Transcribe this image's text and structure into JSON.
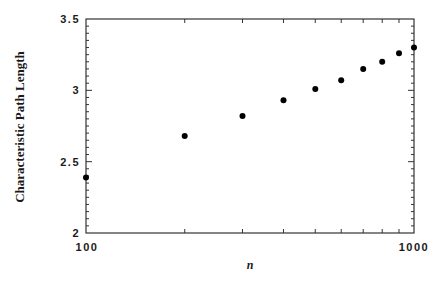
{
  "chart_data": {
    "type": "scatter",
    "title": "",
    "xlabel": "n",
    "ylabel": "Characteristic Path Length",
    "xscale": "log",
    "xlim": [
      100,
      1000
    ],
    "ylim": [
      2,
      3.5
    ],
    "x_tick_labels": [
      "100",
      "1000"
    ],
    "y_tick_labels": [
      "2",
      "2.5",
      "3",
      "3.5"
    ],
    "grid": false,
    "legend": null,
    "x": [
      100,
      200,
      300,
      400,
      500,
      600,
      700,
      800,
      900,
      1000
    ],
    "y": [
      2.39,
      2.68,
      2.82,
      2.93,
      3.01,
      3.07,
      3.15,
      3.2,
      3.26,
      3.3
    ],
    "marker_color": "#000000"
  }
}
